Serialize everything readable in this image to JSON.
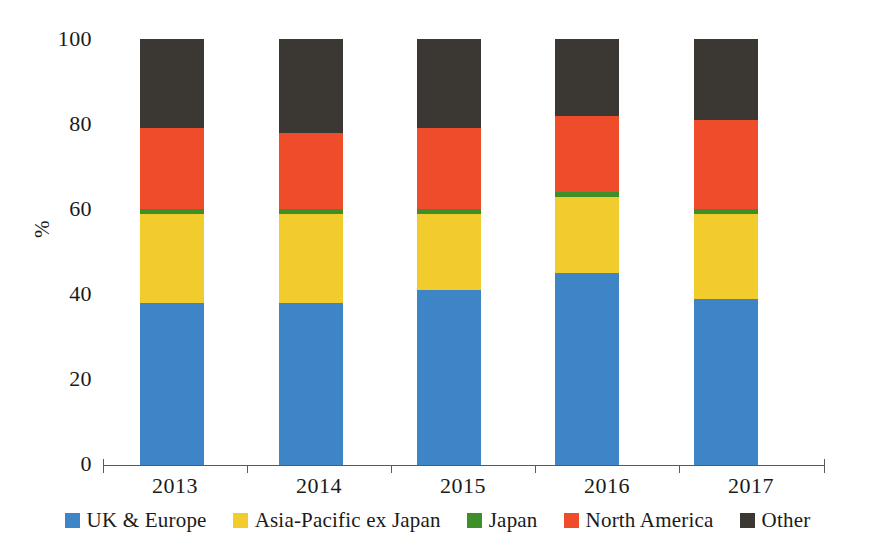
{
  "chart_data": {
    "type": "bar",
    "subtype": "stacked-percentage",
    "title": "",
    "xlabel": "",
    "ylabel": "%",
    "ylim": [
      0,
      100
    ],
    "yticks": [
      "0",
      "20",
      "40",
      "60",
      "80",
      "100"
    ],
    "grid": false,
    "legend_position": "bottom",
    "categories": [
      "2013",
      "2014",
      "2015",
      "2016",
      "2017"
    ],
    "series": [
      {
        "name": "UK & Europe",
        "color": "#3d85c6",
        "values": [
          38,
          38,
          41,
          45,
          39
        ]
      },
      {
        "name": "Asia-Pacific ex Japan",
        "color": "#f2cc2d",
        "values": [
          21,
          21,
          18,
          18,
          20
        ]
      },
      {
        "name": "Japan",
        "color": "#3f8f29",
        "values": [
          1,
          1,
          1,
          1,
          1
        ]
      },
      {
        "name": "North America",
        "color": "#ef4c2c",
        "values": [
          19,
          18,
          19,
          18,
          21
        ]
      },
      {
        "name": "Other",
        "color": "#3b3732",
        "values": [
          21,
          22,
          21,
          18,
          19
        ]
      }
    ]
  },
  "axes": {
    "y_title": "%",
    "y_ticks": [
      "100",
      "80",
      "60",
      "40",
      "20",
      "0"
    ],
    "x_ticks": [
      "2013",
      "2014",
      "2015",
      "2016",
      "2017"
    ]
  },
  "legend": {
    "items": [
      {
        "label": "UK & Europe",
        "color": "#3d85c6"
      },
      {
        "label": "Asia-Pacific ex Japan",
        "color": "#f2cc2d"
      },
      {
        "label": "Japan",
        "color": "#3f8f29"
      },
      {
        "label": "North America",
        "color": "#ef4c2c"
      },
      {
        "label": "Other",
        "color": "#3b3732"
      }
    ]
  },
  "colors": {
    "axis": "#5a5a52",
    "text": "#1a1a1a",
    "background": "#ffffff"
  }
}
